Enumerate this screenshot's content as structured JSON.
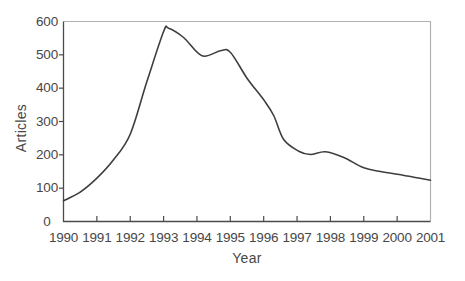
{
  "chart_data": {
    "type": "line",
    "title": "",
    "xlabel": "Year",
    "ylabel": "Articles",
    "xlim": [
      1990,
      2001
    ],
    "ylim": [
      0,
      600
    ],
    "grid": false,
    "legend": "none",
    "x_tick_labels": [
      "1990",
      "1991",
      "1992",
      "1993",
      "1994",
      "1995",
      "1996",
      "1997",
      "1998",
      "1999",
      "2000",
      "2001"
    ],
    "y_tick_labels": [
      "0",
      "100",
      "200",
      "300",
      "400",
      "500",
      "600"
    ],
    "series": [
      {
        "name": "Articles",
        "x": [
          1990,
          1991,
          1992,
          1993,
          1994,
          1995,
          1996,
          1997,
          1998,
          1999,
          2000,
          2001
        ],
        "values": [
          62,
          130,
          262,
          570,
          503,
          508,
          365,
          211,
          204,
          161,
          142,
          124
        ]
      }
    ],
    "curve_points": [
      [
        1990,
        62
      ],
      [
        1990.5,
        88
      ],
      [
        1991,
        130
      ],
      [
        1991.5,
        185
      ],
      [
        1992,
        262
      ],
      [
        1992.5,
        420
      ],
      [
        1993,
        570
      ],
      [
        1993.15,
        580
      ],
      [
        1993.6,
        552
      ],
      [
        1994.15,
        497
      ],
      [
        1994.7,
        512
      ],
      [
        1995,
        508
      ],
      [
        1995.5,
        430
      ],
      [
        1996,
        365
      ],
      [
        1996.3,
        318
      ],
      [
        1996.6,
        246
      ],
      [
        1997.05,
        211
      ],
      [
        1997.4,
        201
      ],
      [
        1997.85,
        209
      ],
      [
        1998.4,
        192
      ],
      [
        1999,
        161
      ],
      [
        1999.5,
        150
      ],
      [
        2000,
        142
      ],
      [
        2000.5,
        133
      ],
      [
        2001,
        124
      ]
    ],
    "colors": {
      "line": "#3e3e3e",
      "axis": "#4b4b4b",
      "box_border": "#b2b2b2",
      "text": "#474747",
      "background": "#ffffff"
    }
  }
}
